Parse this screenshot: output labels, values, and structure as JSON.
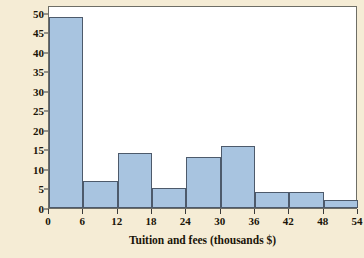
{
  "chart_data": {
    "type": "bar",
    "title": "",
    "subtitle": "",
    "xlabel": "Tuition and fees (thousands $)",
    "ylabel": "Number of Illinois colleges",
    "bin_width": 6,
    "bin_edges": [
      0,
      6,
      12,
      18,
      24,
      30,
      36,
      42,
      48,
      54
    ],
    "categories": [
      "0-6",
      "6-12",
      "12-18",
      "18-24",
      "24-30",
      "30-36",
      "36-42",
      "42-48",
      "48-54"
    ],
    "values": [
      49,
      7,
      14,
      5,
      13,
      16,
      4,
      4,
      2
    ],
    "xlim": [
      0,
      54
    ],
    "ylim": [
      0,
      52
    ],
    "xticks": [
      0,
      6,
      12,
      18,
      24,
      30,
      36,
      42,
      48,
      54
    ],
    "yticks": [
      0,
      5,
      10,
      15,
      20,
      25,
      30,
      35,
      40,
      45,
      50
    ],
    "grid": false,
    "legend": "none",
    "colors": {
      "page_background": "#f5ecd5",
      "plot_background": "#ffffff",
      "bar_fill": "#a8c4e0",
      "bar_edge": "#4d5a6b",
      "frame": "#6e6e66",
      "text": "#1a1408"
    }
  }
}
